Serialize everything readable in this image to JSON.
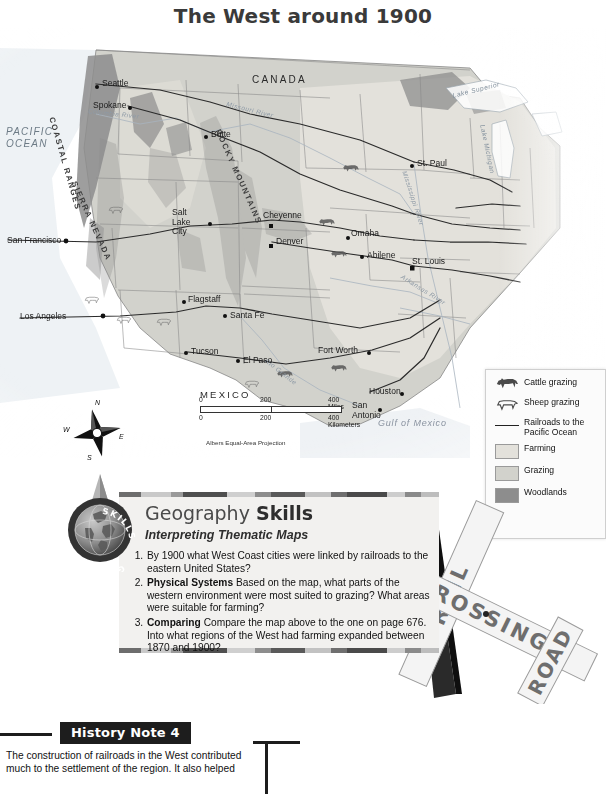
{
  "map": {
    "title": "The West around 1900",
    "countries": [
      "CANADA",
      "MEXICO"
    ],
    "water_labels": {
      "pacific": "PACIFIC\nOCEAN",
      "pacific_line1": "PACIFIC",
      "pacific_line2": "OCEAN",
      "gulf": "Gulf of Mexico",
      "lake_superior": "Lake Superior",
      "lake_michigan": "Lake Michigan"
    },
    "rivers": [
      "Columbia River",
      "Missouri River",
      "Mississippi River",
      "Arkansas River",
      "Rio Grande"
    ],
    "ranges": [
      "COASTAL RANGES",
      "SIERRA NEVADA",
      "ROCKY MOUNTAINS"
    ],
    "cities": [
      {
        "name": "Seattle",
        "x": 96,
        "y": 55,
        "anchor": "right"
      },
      {
        "name": "Spokane",
        "x": 128,
        "y": 77,
        "anchor": "right"
      },
      {
        "name": "Butte",
        "x": 207,
        "y": 106,
        "anchor": "right"
      },
      {
        "name": "St. Paul",
        "x": 414,
        "y": 135,
        "anchor": "left"
      },
      {
        "name": "Salt Lake City",
        "x": 176,
        "y": 193,
        "anchor": "right"
      },
      {
        "name": "Cheyenne",
        "x": 270,
        "y": 189,
        "anchor": "right"
      },
      {
        "name": "Denver",
        "x": 272,
        "y": 214,
        "anchor": "right"
      },
      {
        "name": "Omaha",
        "x": 350,
        "y": 207,
        "anchor": "right"
      },
      {
        "name": "Abilene",
        "x": 366,
        "y": 226,
        "anchor": "right"
      },
      {
        "name": "St. Louis",
        "x": 413,
        "y": 236,
        "anchor": "right"
      },
      {
        "name": "San Francisco",
        "x": 7,
        "y": 211,
        "anchor": "left"
      },
      {
        "name": "Flagstaff",
        "x": 185,
        "y": 270,
        "anchor": "right"
      },
      {
        "name": "Santa Fe",
        "x": 228,
        "y": 286,
        "anchor": "right"
      },
      {
        "name": "Los Angeles",
        "x": 20,
        "y": 287,
        "anchor": "left"
      },
      {
        "name": "Tucson",
        "x": 188,
        "y": 322,
        "anchor": "right"
      },
      {
        "name": "El Paso",
        "x": 240,
        "y": 330,
        "anchor": "right"
      },
      {
        "name": "Fort Worth",
        "x": 322,
        "y": 322,
        "anchor": "right"
      },
      {
        "name": "Houston",
        "x": 370,
        "y": 363,
        "anchor": "right"
      },
      {
        "name": "San Antonio",
        "x": 354,
        "y": 381,
        "anchor": "right"
      }
    ],
    "scale": {
      "miles_ticks": [
        "0",
        "200",
        "400 Miles"
      ],
      "km_ticks": [
        "0",
        "200",
        "400 Kilometers"
      ],
      "projection": "Albers Equal-Area Projection"
    },
    "compass": {
      "n": "N",
      "s": "S",
      "e": "E",
      "w": "W"
    },
    "legend": {
      "items": [
        {
          "key": "cattle-icon",
          "label": "Cattle grazing",
          "color": ""
        },
        {
          "key": "sheep-icon",
          "label": "Sheep grazing",
          "color": ""
        },
        {
          "key": "railroad-line",
          "label": "Railroads to the\nPacific Ocean",
          "color": "#222222",
          "line1": "Railroads to the",
          "line2": "Pacific Ocean"
        },
        {
          "key": "farming-swatch",
          "label": "Farming",
          "color": "#e3e1db"
        },
        {
          "key": "grazing-swatch",
          "label": "Grazing",
          "color": "#d2d2cc"
        },
        {
          "key": "woodlands-swatch",
          "label": "Woodlands",
          "color": "#8d8d8d"
        }
      ]
    },
    "colors": {
      "farming": "#e3e1db",
      "grazing": "#d2d2cc",
      "woodlands": "#8d8d8d",
      "water": "#e8edf1",
      "border": "#6b6b6b",
      "railroad": "#2b2b2b"
    }
  },
  "geography_skills": {
    "title_regular": "Geography ",
    "title_bold": "Skills",
    "subtitle": "Interpreting Thematic Maps",
    "globe_ring_text": "GEOGRAPHY SKILLS",
    "questions": [
      {
        "number": "1.",
        "lead": "",
        "text": "By 1900 what West Coast cities were linked by railroads to the eastern United States?"
      },
      {
        "number": "2.",
        "lead": "Physical Systems",
        "text": "Based on the map, what parts of the western environment were most suited to grazing? What areas were suitable for farming?"
      },
      {
        "number": "3.",
        "lead": "Comparing",
        "text": "Compare the map above to the one on page 676. Into what regions of the West had farming expanded between 1870 and 1900?"
      }
    ]
  },
  "railroad_sign": {
    "word_top": "RAILROAD",
    "word_cross": "CROSSING",
    "arm1": "RAIL",
    "arm2": "ROAD",
    "arm3": "CROSSING"
  },
  "history_note": {
    "badge": "History Note 4",
    "body": "The construction of railroads in the West contributed much to the settlement of the region. It also helped"
  }
}
